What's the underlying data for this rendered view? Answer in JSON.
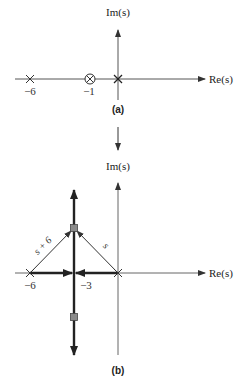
{
  "panel_a": {
    "im_label": "Im(s)",
    "re_label": "Re(s)",
    "ticks": [
      {
        "label": "−6",
        "x": 30
      },
      {
        "label": "−1",
        "x": 90
      }
    ],
    "poles": [
      -6,
      0
    ],
    "zeros": [
      -1
    ],
    "caption": "(a)"
  },
  "transition_arrow": "down-arrow",
  "panel_b": {
    "im_label": "Im(s)",
    "re_label": "Re(s)",
    "ticks": [
      {
        "label": "−6",
        "x": 30
      },
      {
        "label": "−3",
        "x": 74
      }
    ],
    "poles": [
      -6,
      0
    ],
    "breakaway": -3,
    "vector_labels": {
      "from_minus6": "s + 6",
      "from_origin": "s"
    },
    "caption": "(b)"
  },
  "colors": {
    "axis": "#555555",
    "locus": "#222222",
    "marker_fill": "#8a8a8a"
  }
}
